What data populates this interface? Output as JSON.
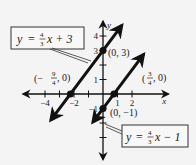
{
  "chart_data": {
    "type": "line",
    "title": "",
    "xlabel": "x",
    "ylabel": "y",
    "xlim": [
      -5.5,
      4.5
    ],
    "ylim": [
      -4.5,
      5
    ],
    "grid": false,
    "x_ticks": [
      -4,
      -2,
      1,
      2
    ],
    "x_tick_labels": [
      "-4",
      "-2",
      "1",
      "2"
    ],
    "x_minor_ticks": [
      -3,
      -1
    ],
    "y_ticks": [
      4,
      3,
      1,
      -1
    ],
    "y_tick_labels": [
      "4",
      "3",
      "1",
      "-1"
    ],
    "y_minor_ticks": [
      2,
      -2,
      -3
    ],
    "series": [
      {
        "name": "y = 4/3 x + 3",
        "slope": 1.3333,
        "intercept": 3,
        "x_range": [
          -3.6,
          1.3
        ],
        "label": "y = ⁴⁄₃x + 3",
        "points": [
          {
            "x": 0,
            "y": 3,
            "label": "(0, 3)"
          },
          {
            "x": -2.25,
            "y": 0,
            "label": "(−9/4, 0)"
          }
        ]
      },
      {
        "name": "y = 4/3 x - 1",
        "slope": 1.3333,
        "intercept": -1,
        "x_range": [
          -0.7,
          2.8
        ],
        "label": "y = ⁴⁄₃x − 1",
        "points": [
          {
            "x": 0,
            "y": -1,
            "label": "(0, −1)"
          },
          {
            "x": 0.75,
            "y": 0,
            "label": "(3/4, 0)"
          }
        ]
      }
    ]
  },
  "labels": {
    "eq1_y": "y",
    "eq1_eq": "=",
    "eq1_num": "4",
    "eq1_den": "3",
    "eq1_rest": "x + 3",
    "eq2_y": "y",
    "eq2_eq": "=",
    "eq2_num": "4",
    "eq2_den": "3",
    "eq2_rest": "x − 1",
    "pt_0_3": "(0, 3)",
    "pt_0_m1": "(0, −1)",
    "pt_m94_lparen": "(−",
    "pt_m94_num": "9",
    "pt_m94_den": "4",
    "pt_m94_rest": ", 0)",
    "pt_34_lparen": "(",
    "pt_34_num": "3",
    "pt_34_den": "4",
    "pt_34_rest": ", 0)"
  }
}
